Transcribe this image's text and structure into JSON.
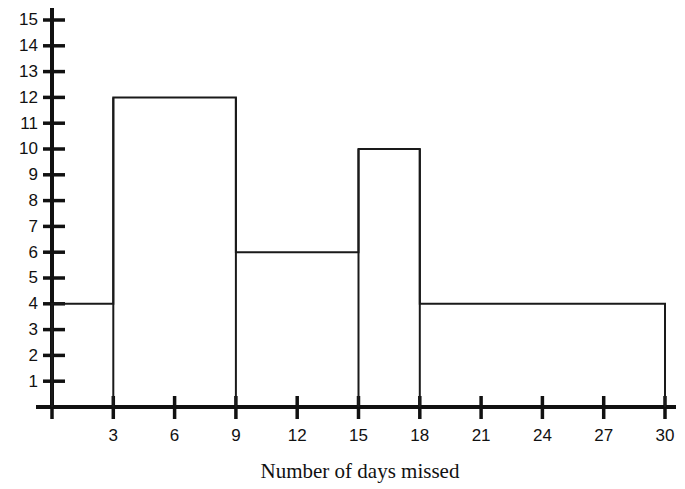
{
  "chart_data": {
    "type": "bar",
    "title": "",
    "subtitle": "",
    "xlabel": "Number of days missed",
    "ylabel": "",
    "grid": false,
    "legend": false,
    "legend_position": "none",
    "orientation": "vertical",
    "style": "histogram-step-outline",
    "xlim": [
      0,
      30
    ],
    "ylim": [
      0,
      15
    ],
    "xticks": [
      3,
      6,
      9,
      12,
      15,
      18,
      21,
      24,
      27,
      30
    ],
    "xtick_labels": [
      "3",
      "6",
      "9",
      "12",
      "15",
      "18",
      "21",
      "24",
      "27",
      "30"
    ],
    "yticks": [
      1,
      2,
      3,
      4,
      5,
      6,
      7,
      8,
      9,
      10,
      11,
      12,
      13,
      14,
      15
    ],
    "ytick_labels": [
      "1",
      "2",
      "3",
      "4",
      "5",
      "6",
      "7",
      "8",
      "9",
      "10",
      "11",
      "12",
      "13",
      "14",
      "15"
    ],
    "bins": [
      {
        "start": 0,
        "end": 3,
        "value": 4,
        "label": "0-3"
      },
      {
        "start": 3,
        "end": 9,
        "value": 12,
        "label": "3-9"
      },
      {
        "start": 9,
        "end": 15,
        "value": 6,
        "label": "9-15"
      },
      {
        "start": 15,
        "end": 18,
        "value": 10,
        "label": "15-18"
      },
      {
        "start": 18,
        "end": 30,
        "value": 4,
        "label": "18-30"
      }
    ],
    "categories": [
      "0-3",
      "3-9",
      "9-15",
      "15-18",
      "18-30"
    ],
    "values": [
      4,
      12,
      6,
      10,
      4
    ],
    "colors": {
      "line": "#1a1a1a",
      "axis": "#111111",
      "fill": "#ffffff",
      "background": "#ffffff",
      "text": "#111111"
    }
  },
  "axis": {
    "x_title": "Number of days missed"
  }
}
